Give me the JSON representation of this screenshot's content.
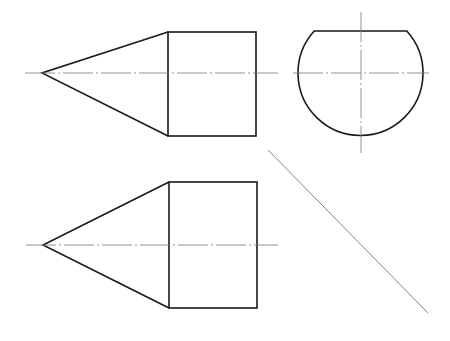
{
  "drawing": {
    "type": "orthographic-projection",
    "colors": {
      "outline": "#1a1a1a",
      "centerline": "#777777",
      "background": "#ffffff"
    },
    "views": {
      "front": {
        "apex": [
          42,
          73
        ],
        "rect": {
          "x": 168,
          "y": 32,
          "w": 88,
          "h": 104
        },
        "centerline": {
          "x1": 25,
          "x2": 278,
          "y": 73
        }
      },
      "side": {
        "circle": {
          "cx": 360.5,
          "cy": 73,
          "r": 62.5
        },
        "chord": {
          "x1": 314,
          "x2": 407,
          "y": 31
        },
        "h_centerline": {
          "x1": 293,
          "x2": 429,
          "y": 73
        },
        "v_centerline": {
          "x": 361,
          "y1": 12,
          "y2": 153
        }
      },
      "top": {
        "apex": [
          43,
          245
        ],
        "rect": {
          "x": 169,
          "y": 182,
          "w": 88,
          "h": 126
        },
        "centerline": {
          "x1": 26,
          "x2": 278,
          "y": 245
        }
      },
      "miter_line": {
        "x1": 268,
        "y1": 150,
        "x2": 428,
        "y2": 313
      }
    }
  }
}
